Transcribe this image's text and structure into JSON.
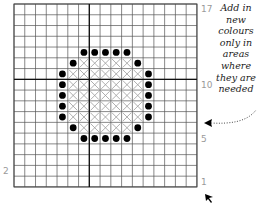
{
  "diagram": {
    "type": "cross-stitch-chart",
    "grid": {
      "columns": 17,
      "rows": 17,
      "origin_x": 14,
      "origin_y": 4,
      "cell_size": 10.76,
      "line_color": "#555555",
      "major_line_color": "#111111",
      "major_line_col": 7,
      "major_line_row": 7
    },
    "row_labels": [
      {
        "text": "17",
        "row_from_top": 0,
        "side": "right"
      },
      {
        "text": "10",
        "row_from_top": 7,
        "side": "right"
      },
      {
        "text": "5",
        "row_from_top": 12,
        "side": "right"
      },
      {
        "text": "1",
        "row_from_top": 16,
        "side": "right"
      },
      {
        "text": "2",
        "row_from_top": 15,
        "side": "left"
      }
    ],
    "dots": {
      "color": "#000000",
      "cells": [
        [
          4,
          6
        ],
        [
          4,
          7
        ],
        [
          4,
          8
        ],
        [
          4,
          9
        ],
        [
          4,
          10
        ],
        [
          5,
          5
        ],
        [
          5,
          11
        ],
        [
          6,
          4
        ],
        [
          6,
          12
        ],
        [
          7,
          4
        ],
        [
          7,
          12
        ],
        [
          8,
          4
        ],
        [
          8,
          12
        ],
        [
          9,
          4
        ],
        [
          9,
          12
        ],
        [
          10,
          4
        ],
        [
          10,
          12
        ],
        [
          11,
          5
        ],
        [
          11,
          11
        ],
        [
          12,
          6
        ],
        [
          12,
          7
        ],
        [
          12,
          8
        ],
        [
          12,
          9
        ],
        [
          12,
          10
        ]
      ]
    },
    "crosses": {
      "color": "#9a9a9a",
      "rows": [
        {
          "row": 5,
          "from_col": 6,
          "to_col": 10
        },
        {
          "row": 6,
          "from_col": 5,
          "to_col": 11
        },
        {
          "row": 7,
          "from_col": 5,
          "to_col": 11
        },
        {
          "row": 8,
          "from_col": 5,
          "to_col": 11
        },
        {
          "row": 9,
          "from_col": 5,
          "to_col": 11
        },
        {
          "row": 10,
          "from_col": 5,
          "to_col": 11
        },
        {
          "row": 11,
          "from_col": 6,
          "to_col": 10
        }
      ]
    },
    "annotation": {
      "lines": [
        "Add in",
        "new",
        "colours",
        "only in",
        "areas",
        "where",
        "they are",
        "needed"
      ],
      "arrow": "dotted-curved-arrow-left"
    },
    "corner_marker": "cursor-arrow-icon"
  }
}
